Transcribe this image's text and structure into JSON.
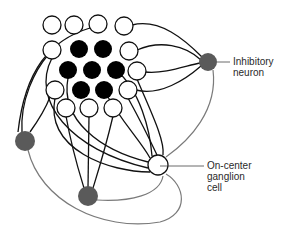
{
  "labels": {
    "inhibitory": [
      "Inhibitory",
      "neuron"
    ],
    "ganglion": [
      "On-center",
      "ganglion",
      "cell"
    ]
  },
  "colors": {
    "stroke": "#111111",
    "center_fill": "#000000",
    "surround_fill": "#ffffff",
    "inhibitory_fill": "#5a5a5a",
    "feedback_stroke": "#7a7a7a",
    "leader_line": "#444444"
  },
  "photoreceptors": {
    "center": [
      {
        "x": 79,
        "y": 49
      },
      {
        "x": 103,
        "y": 49
      },
      {
        "x": 68,
        "y": 70
      },
      {
        "x": 92,
        "y": 70
      },
      {
        "x": 116,
        "y": 70
      },
      {
        "x": 81,
        "y": 90
      },
      {
        "x": 104,
        "y": 90
      }
    ],
    "surround": [
      {
        "x": 52,
        "y": 25
      },
      {
        "x": 74,
        "y": 25
      },
      {
        "x": 98,
        "y": 24
      },
      {
        "x": 124,
        "y": 26
      },
      {
        "x": 52,
        "y": 50
      },
      {
        "x": 129,
        "y": 51
      },
      {
        "x": 137,
        "y": 71
      },
      {
        "x": 55,
        "y": 90
      },
      {
        "x": 128,
        "y": 90
      },
      {
        "x": 66,
        "y": 108
      },
      {
        "x": 89,
        "y": 108
      },
      {
        "x": 113,
        "y": 108
      }
    ]
  },
  "neurons": {
    "inhibitory_right": {
      "x": 208,
      "y": 62
    },
    "inhibitory_left": {
      "x": 25,
      "y": 141
    },
    "inhibitory_bottom": {
      "x": 88,
      "y": 196
    },
    "ganglion": {
      "x": 158,
      "y": 165
    }
  }
}
